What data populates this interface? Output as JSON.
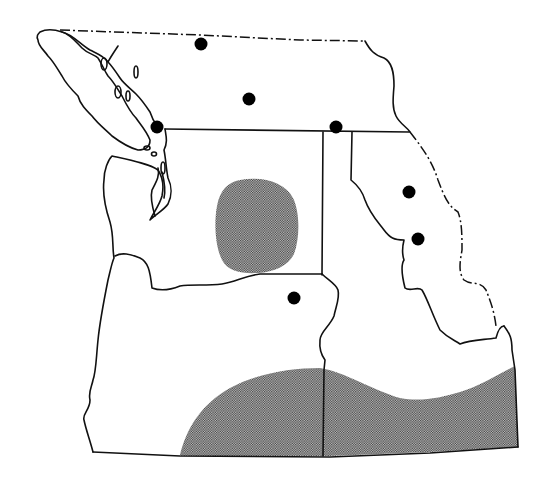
{
  "map": {
    "title": "",
    "region": "Pacific Northwest (southern British Columbia, Washington, Oregon, Idaho, western Montana)",
    "colors": {
      "background": "#ffffff",
      "line": "#111111",
      "stipple_dark": "#3a3a3a",
      "dot": "#000000"
    },
    "symbols": {
      "locality_dots": [
        {
          "id": "dot-1",
          "x": 201,
          "y": 44
        },
        {
          "id": "dot-2",
          "x": 249,
          "y": 99
        },
        {
          "id": "dot-3",
          "x": 157,
          "y": 127
        },
        {
          "id": "dot-4",
          "x": 336,
          "y": 127
        },
        {
          "id": "dot-5",
          "x": 409,
          "y": 192
        },
        {
          "id": "dot-6",
          "x": 418,
          "y": 239
        },
        {
          "id": "dot-7",
          "x": 294,
          "y": 298
        }
      ],
      "stippled_ranges": [
        {
          "id": "range-central-washington",
          "shape": "oval"
        },
        {
          "id": "range-southern-oregon-idaho",
          "shape": "band"
        }
      ]
    },
    "boundaries": [
      {
        "id": "canada-border-dashed",
        "style": "dash-dot"
      },
      {
        "id": "international-border-49th",
        "style": "solid"
      },
      {
        "id": "washington-idaho-border",
        "style": "solid"
      },
      {
        "id": "washington-oregon-border",
        "style": "solid"
      },
      {
        "id": "oregon-idaho-border",
        "style": "solid"
      },
      {
        "id": "idaho-montana-border",
        "style": "dash-dot"
      },
      {
        "id": "southern-border",
        "style": "solid"
      },
      {
        "id": "pacific-coastline",
        "style": "solid"
      }
    ]
  }
}
